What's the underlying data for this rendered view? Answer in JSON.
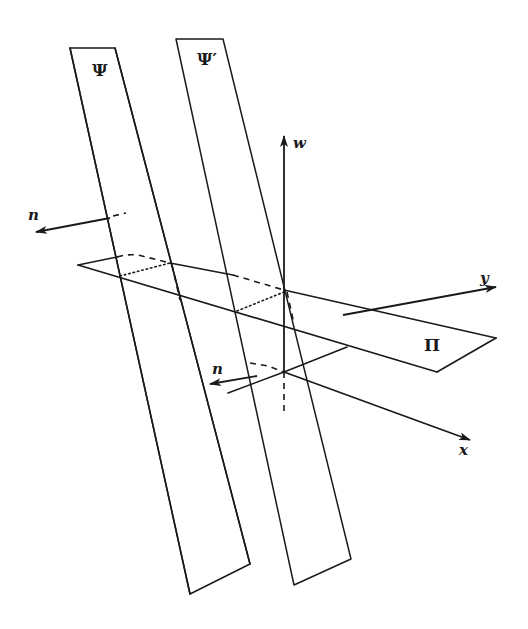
{
  "figure": {
    "width": 528,
    "height": 629,
    "background": "#ffffff",
    "stroke_color": "#1a1a1a"
  },
  "planes": {
    "psi": {
      "label": "Ψ",
      "points": "70,48 115,48 250,564 190,594",
      "label_pos": [
        92,
        76
      ]
    },
    "psi_prime": {
      "label": "Ψ′",
      "points": "176,39 223,39 351,559 294,585",
      "label_pos": [
        197,
        65
      ]
    },
    "pi": {
      "label": "Π",
      "label_pos": [
        428,
        351
      ]
    }
  },
  "axes": {
    "w": {
      "label": "w",
      "label_pos": [
        294,
        146
      ]
    },
    "x": {
      "label": "x",
      "label_pos": [
        460,
        454
      ]
    },
    "y": {
      "label": "y",
      "label_pos": [
        480,
        283
      ]
    }
  },
  "normals": {
    "n_upper": {
      "label": "n",
      "label_pos": [
        28,
        220
      ]
    },
    "n_lower": {
      "label": "n",
      "label_pos": [
        212,
        373
      ]
    }
  }
}
